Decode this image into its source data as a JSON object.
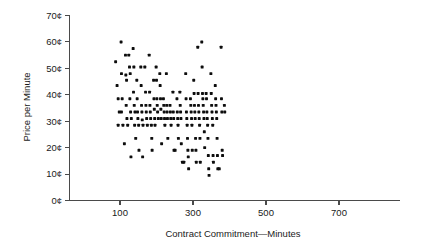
{
  "chart_data": {
    "type": "scatter",
    "title": "",
    "xlabel": "Contract Commitment—Minutes",
    "ylabel": "Price per Minute",
    "xlim": [
      0,
      800
    ],
    "ylim": [
      0,
      70
    ],
    "grid": false,
    "legend": null,
    "x_ticks": [
      100,
      300,
      500,
      700
    ],
    "x_tick_labels": [
      "100",
      "300",
      "500",
      "700"
    ],
    "y_ticks": [
      0,
      10,
      20,
      30,
      40,
      50,
      60,
      70
    ],
    "y_tick_labels": [
      "0¢",
      "10¢",
      "20¢",
      "30¢",
      "40¢",
      "50¢",
      "60¢",
      "70¢"
    ],
    "marker": "filled-square",
    "marker_color": "#0d0d0d",
    "points": [
      [
        88,
        52.5
      ],
      [
        92,
        43.5
      ],
      [
        95,
        38.5
      ],
      [
        98,
        33.5
      ],
      [
        95,
        28.5
      ],
      [
        103,
        60.0
      ],
      [
        104,
        48.0
      ],
      [
        106,
        38.5
      ],
      [
        104,
        33.5
      ],
      [
        108,
        28.5
      ],
      [
        112,
        21.5
      ],
      [
        115,
        55.0
      ],
      [
        116,
        47.5
      ],
      [
        118,
        45.5
      ],
      [
        117,
        36.0
      ],
      [
        119,
        31.0
      ],
      [
        121,
        28.5
      ],
      [
        124,
        55.0
      ],
      [
        126,
        50.5
      ],
      [
        128,
        48.0
      ],
      [
        127,
        38.5
      ],
      [
        129,
        33.5
      ],
      [
        131,
        31.0
      ],
      [
        130,
        16.5
      ],
      [
        136,
        57.5
      ],
      [
        138,
        50.5
      ],
      [
        137,
        41.0
      ],
      [
        139,
        36.0
      ],
      [
        141,
        33.5
      ],
      [
        140,
        28.5
      ],
      [
        143,
        23.5
      ],
      [
        146,
        45.5
      ],
      [
        147,
        38.5
      ],
      [
        148,
        33.5
      ],
      [
        149,
        31.0
      ],
      [
        151,
        28.5
      ],
      [
        152,
        19.0
      ],
      [
        157,
        50.5
      ],
      [
        158,
        43.5
      ],
      [
        159,
        36.0
      ],
      [
        160,
        33.5
      ],
      [
        161,
        30.5
      ],
      [
        163,
        28.5
      ],
      [
        162,
        16.5
      ],
      [
        168,
        50.5
      ],
      [
        170,
        41.0
      ],
      [
        171,
        36.0
      ],
      [
        172,
        33.5
      ],
      [
        173,
        31.0
      ],
      [
        175,
        28.5
      ],
      [
        180,
        55.0
      ],
      [
        181,
        41.0
      ],
      [
        182,
        36.0
      ],
      [
        183,
        33.5
      ],
      [
        184,
        31.0
      ],
      [
        186,
        28.5
      ],
      [
        187,
        23.5
      ],
      [
        188,
        19.0
      ],
      [
        192,
        45.5
      ],
      [
        193,
        38.5
      ],
      [
        194,
        34.5
      ],
      [
        195,
        31.0
      ],
      [
        196,
        28.5
      ],
      [
        199,
        50.5
      ],
      [
        200,
        45.5
      ],
      [
        201,
        38.5
      ],
      [
        202,
        36.0
      ],
      [
        203,
        33.5
      ],
      [
        205,
        31.0
      ],
      [
        209,
        48.0
      ],
      [
        210,
        43.5
      ],
      [
        211,
        38.5
      ],
      [
        212,
        34.5
      ],
      [
        213,
        31.0
      ],
      [
        214,
        21.5
      ],
      [
        219,
        38.5
      ],
      [
        220,
        36.0
      ],
      [
        221,
        33.5
      ],
      [
        222,
        31.0
      ],
      [
        223,
        28.5
      ],
      [
        227,
        48.0
      ],
      [
        228,
        36.0
      ],
      [
        229,
        33.5
      ],
      [
        230,
        31.0
      ],
      [
        231,
        23.5
      ],
      [
        237,
        36.0
      ],
      [
        238,
        33.5
      ],
      [
        239,
        31.0
      ],
      [
        240,
        28.5
      ],
      [
        245,
        41.0
      ],
      [
        246,
        33.5
      ],
      [
        247,
        31.0
      ],
      [
        248,
        19.0
      ],
      [
        251,
        19.0
      ],
      [
        256,
        38.5
      ],
      [
        257,
        33.5
      ],
      [
        258,
        31.0
      ],
      [
        259,
        28.5
      ],
      [
        260,
        23.5
      ],
      [
        264,
        41.0
      ],
      [
        265,
        36.0
      ],
      [
        266,
        33.5
      ],
      [
        267,
        31.0
      ],
      [
        268,
        21.5
      ],
      [
        271,
        14.5
      ],
      [
        275,
        14.5
      ],
      [
        280,
        48.0
      ],
      [
        281,
        38.5
      ],
      [
        282,
        33.5
      ],
      [
        283,
        31.0
      ],
      [
        284,
        28.5
      ],
      [
        285,
        23.5
      ],
      [
        286,
        19.0
      ],
      [
        287,
        16.5
      ],
      [
        288,
        12.0
      ],
      [
        293,
        38.5
      ],
      [
        294,
        36.0
      ],
      [
        295,
        33.5
      ],
      [
        296,
        31.0
      ],
      [
        297,
        28.5
      ],
      [
        298,
        19.0
      ],
      [
        302,
        45.5
      ],
      [
        303,
        40.5
      ],
      [
        304,
        36.0
      ],
      [
        305,
        33.5
      ],
      [
        306,
        31.0
      ],
      [
        307,
        23.5
      ],
      [
        308,
        19.0
      ],
      [
        309,
        14.5
      ],
      [
        313,
        58.0
      ],
      [
        314,
        40.5
      ],
      [
        315,
        36.0
      ],
      [
        316,
        33.5
      ],
      [
        317,
        31.0
      ],
      [
        318,
        28.5
      ],
      [
        319,
        23.5
      ],
      [
        320,
        14.5
      ],
      [
        324,
        60.0
      ],
      [
        325,
        50.5
      ],
      [
        326,
        40.5
      ],
      [
        327,
        38.5
      ],
      [
        328,
        36.0
      ],
      [
        329,
        33.5
      ],
      [
        330,
        31.0
      ],
      [
        331,
        26.0
      ],
      [
        332,
        20.0
      ],
      [
        336,
        40.5
      ],
      [
        337,
        38.5
      ],
      [
        338,
        33.5
      ],
      [
        339,
        31.0
      ],
      [
        340,
        28.5
      ],
      [
        341,
        23.5
      ],
      [
        342,
        17.0
      ],
      [
        343,
        12.0
      ],
      [
        344,
        9.5
      ],
      [
        349,
        48.0
      ],
      [
        350,
        40.5
      ],
      [
        351,
        36.0
      ],
      [
        352,
        33.5
      ],
      [
        353,
        31.0
      ],
      [
        354,
        28.5
      ],
      [
        355,
        17.0
      ],
      [
        356,
        14.5
      ],
      [
        361,
        43.5
      ],
      [
        362,
        38.5
      ],
      [
        363,
        36.0
      ],
      [
        364,
        33.5
      ],
      [
        365,
        31.0
      ],
      [
        366,
        23.5
      ],
      [
        367,
        17.0
      ],
      [
        368,
        12.0
      ],
      [
        372,
        12.0
      ],
      [
        377,
        58.0
      ],
      [
        378,
        38.5
      ],
      [
        379,
        33.5
      ],
      [
        380,
        19.0
      ],
      [
        381,
        17.0
      ],
      [
        386,
        36.0
      ],
      [
        387,
        33.5
      ]
    ]
  }
}
